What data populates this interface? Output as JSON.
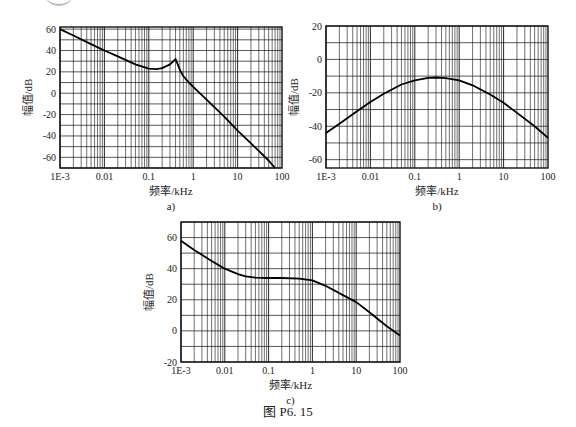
{
  "figure": {
    "caption": "图 P6. 15"
  },
  "chart_data": [
    {
      "id": "a",
      "type": "line",
      "sublabel": "a)",
      "title": "",
      "xlabel": "频率/kHz",
      "ylabel": "幅值/dB",
      "xscale": "log",
      "xlim": [
        0.001,
        100
      ],
      "ylim": [
        -70,
        62
      ],
      "xticks": [
        0.001,
        0.01,
        0.1,
        1,
        10,
        100
      ],
      "xtick_labels": [
        "1E-3",
        "0.01",
        "0.1",
        "1",
        "10",
        "100"
      ],
      "yticks": [
        60,
        40,
        20,
        0,
        -20,
        -40,
        -60
      ],
      "ytick_labels": [
        "60",
        "40",
        "20",
        "0",
        "-20",
        "-40",
        "-60"
      ],
      "ygrid_step": 10,
      "grid": true,
      "legend": null,
      "box": {
        "left": 60,
        "top": 27,
        "width": 222,
        "height": 141
      },
      "series": [
        {
          "name": "magnitude",
          "x": [
            0.001,
            0.002,
            0.005,
            0.01,
            0.02,
            0.05,
            0.1,
            0.15,
            0.2,
            0.3,
            0.35,
            0.4,
            0.45,
            0.5,
            0.6,
            0.8,
            1,
            2,
            5,
            10,
            20,
            50,
            70
          ],
          "y": [
            60,
            54,
            46,
            40,
            34.5,
            27,
            23,
            22.5,
            23.5,
            27,
            29.5,
            32,
            27,
            22,
            16,
            10,
            6,
            -6,
            -22,
            -35,
            -47,
            -63,
            -70
          ]
        }
      ]
    },
    {
      "id": "b",
      "type": "line",
      "sublabel": "b)",
      "title": "",
      "xlabel": "频率/kHz",
      "ylabel": "幅值/dB",
      "xscale": "log",
      "xlim": [
        0.001,
        100
      ],
      "ylim": [
        -65,
        20
      ],
      "xticks": [
        0.001,
        0.01,
        0.1,
        1,
        10,
        100
      ],
      "xtick_labels": [
        "1E-3",
        "0.01",
        "0.1",
        "1",
        "10",
        "100"
      ],
      "yticks": [
        20,
        0,
        -20,
        -40,
        -60
      ],
      "ytick_labels": [
        "20",
        "0",
        "-20",
        "-40",
        "-60"
      ],
      "ygrid_step": 10,
      "grid": true,
      "legend": null,
      "box": {
        "left": 326,
        "top": 26,
        "width": 222,
        "height": 142
      },
      "series": [
        {
          "name": "magnitude",
          "x": [
            0.001,
            0.002,
            0.005,
            0.01,
            0.02,
            0.05,
            0.1,
            0.2,
            0.3,
            0.5,
            1,
            2,
            5,
            10,
            20,
            50,
            100
          ],
          "y": [
            -44,
            -38.5,
            -31,
            -25.5,
            -20.5,
            -15,
            -12.5,
            -11,
            -10.8,
            -11.2,
            -12.5,
            -15.5,
            -21,
            -26,
            -32,
            -40,
            -47
          ]
        }
      ]
    },
    {
      "id": "c",
      "type": "line",
      "sublabel": "c)",
      "title": "",
      "xlabel": "频率/kHz",
      "ylabel": "幅值/dB",
      "xscale": "log",
      "xlim": [
        0.001,
        100
      ],
      "ylim": [
        -20,
        70
      ],
      "xticks": [
        0.001,
        0.01,
        0.1,
        1,
        10,
        100
      ],
      "xtick_labels": [
        "1E-3",
        "0.01",
        "0.1",
        "1",
        "10",
        "100"
      ],
      "yticks": [
        60,
        40,
        20,
        0,
        -20
      ],
      "ytick_labels": [
        "60",
        "40",
        "20",
        "0",
        "-20"
      ],
      "ygrid_step": 10,
      "grid": true,
      "legend": null,
      "box": {
        "left": 181,
        "top": 222,
        "width": 219,
        "height": 140
      },
      "series": [
        {
          "name": "magnitude",
          "x": [
            0.001,
            0.002,
            0.005,
            0.01,
            0.02,
            0.03,
            0.05,
            0.1,
            0.2,
            0.5,
            1,
            2,
            5,
            10,
            20,
            50,
            100
          ],
          "y": [
            58,
            52,
            45,
            40,
            36.5,
            35,
            34.2,
            34,
            34,
            33.6,
            32.5,
            29,
            23,
            18.5,
            12,
            3,
            -3
          ]
        }
      ]
    }
  ]
}
